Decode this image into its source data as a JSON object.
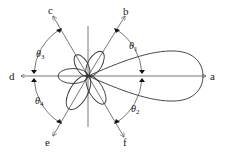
{
  "diagram": {
    "type": "polar-radiation-pattern",
    "center": [
      88,
      76
    ],
    "directions": [
      {
        "id": "a",
        "label": "a",
        "angle_deg": 0
      },
      {
        "id": "b",
        "label": "b",
        "angle_deg": 60
      },
      {
        "id": "c",
        "label": "c",
        "angle_deg": 120
      },
      {
        "id": "d",
        "label": "d",
        "angle_deg": 180
      },
      {
        "id": "e",
        "label": "e",
        "angle_deg": 240
      },
      {
        "id": "f",
        "label": "f",
        "angle_deg": 300
      }
    ],
    "angles": [
      {
        "id": "theta1",
        "label": "θ",
        "sub": "1",
        "between": [
          "a",
          "b"
        ]
      },
      {
        "id": "theta2",
        "label": "θ",
        "sub": "2",
        "between": [
          "a",
          "f"
        ]
      },
      {
        "id": "theta3",
        "label": "θ",
        "sub": "3",
        "between": [
          "c",
          "d"
        ]
      },
      {
        "id": "theta4",
        "label": "θ",
        "sub": "4",
        "between": [
          "d",
          "e"
        ]
      }
    ],
    "lobes": [
      {
        "id": "main-lobe",
        "direction": "a",
        "size": "large"
      },
      {
        "id": "lobe-b",
        "direction": "b",
        "size": "small"
      },
      {
        "id": "lobe-c",
        "direction": "c",
        "size": "small"
      },
      {
        "id": "lobe-d",
        "direction": "d",
        "size": "small"
      },
      {
        "id": "lobe-e",
        "direction": "e",
        "size": "medium"
      },
      {
        "id": "lobe-f",
        "direction": "f",
        "size": "small"
      }
    ]
  }
}
